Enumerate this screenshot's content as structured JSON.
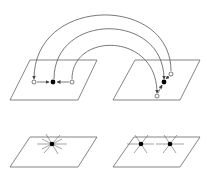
{
  "diagram": {
    "colors": {
      "stroke": "#555555",
      "fill_dot": "#000000",
      "background": "#ffffff"
    },
    "panels": [
      {
        "id": "top-left",
        "points": [
          {
            "type": "open",
            "x": 34,
            "y": 82
          },
          {
            "type": "filled",
            "x": 53,
            "y": 82
          },
          {
            "type": "open",
            "x": 72,
            "y": 82
          }
        ]
      },
      {
        "id": "top-right",
        "points": [
          {
            "type": "open",
            "x": 171,
            "y": 74
          },
          {
            "type": "filled",
            "x": 164,
            "y": 82
          },
          {
            "type": "open",
            "x": 157,
            "y": 96
          }
        ]
      },
      {
        "id": "bottom-left",
        "stars": [
          {
            "x": 52,
            "y": 144
          }
        ]
      },
      {
        "id": "bottom-right",
        "stars": [
          {
            "x": 141,
            "y": 144
          },
          {
            "x": 170,
            "y": 144
          }
        ]
      }
    ],
    "arcs": [
      {
        "name": "outer",
        "from": [
          34,
          80
        ],
        "to": [
          171,
          72
        ]
      },
      {
        "name": "middle",
        "from": [
          53,
          80
        ],
        "to": [
          164,
          80
        ]
      },
      {
        "name": "inner",
        "from": [
          72,
          80
        ],
        "to": [
          157,
          94
        ]
      }
    ]
  }
}
